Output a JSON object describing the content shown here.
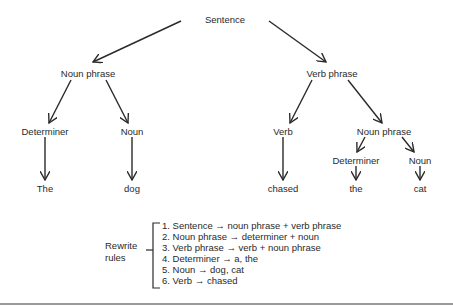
{
  "tree": {
    "root": "Sentence",
    "noun_phrase_1": "Noun phrase",
    "verb_phrase": "Verb phrase",
    "determiner_1": "Determiner",
    "noun_1": "Noun",
    "verb": "Verb",
    "noun_phrase_2": "Noun phrase",
    "determiner_2": "Determiner",
    "noun_2": "Noun",
    "leaf_the_1": "The",
    "leaf_dog": "dog",
    "leaf_chased": "chased",
    "leaf_the_2": "the",
    "leaf_cat": "cat"
  },
  "rewrite_rules": {
    "label_line1": "Rewrite",
    "label_line2": "rules",
    "items": [
      "1.  Sentence → noun phrase  +  verb phrase",
      "2.  Noun phrase → determiner  +  noun",
      "3.  Verb phrase → verb  +  noun phrase",
      "4.  Determiner → a, the",
      "5.  Noun → dog, cat",
      "6.  Verb → chased"
    ]
  },
  "colors": {
    "line": "#2a2a2a",
    "text": "#2a2a2a"
  }
}
